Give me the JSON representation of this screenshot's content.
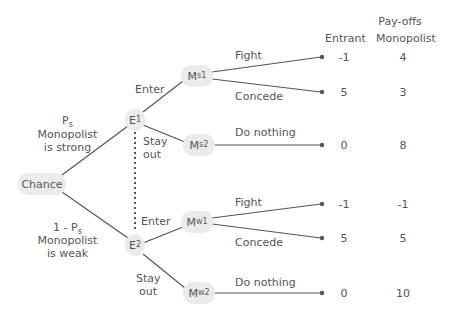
{
  "header": {
    "title": "Pay-offs",
    "col_entrant": "Entrant",
    "col_monopolist": "Monopolist"
  },
  "chance": {
    "label": "Chance",
    "strong_prob": "P",
    "strong_prob_sub": "s",
    "strong_line1": "Monopolist",
    "strong_line2": "is strong",
    "weak_prob": "1 - P",
    "weak_prob_sub": "s",
    "weak_line1": "Monopolist",
    "weak_line2": "is weak"
  },
  "nodes": {
    "e1": {
      "main": "E",
      "sub": "1"
    },
    "e2": {
      "main": "E",
      "sub": "2"
    },
    "ms1": {
      "main": "M",
      "sub": "s1"
    },
    "ms2": {
      "main": "M",
      "sub": "s2"
    },
    "mw1": {
      "main": "M",
      "sub": "w1"
    },
    "mw2": {
      "main": "M",
      "sub": "w2"
    }
  },
  "actions": {
    "enter_top": "Enter",
    "stay_top_1": "Stay",
    "stay_top_2": "out",
    "enter_bottom": "Enter",
    "stay_bottom_1": "Stay",
    "stay_bottom_2": "out",
    "fight_top": "Fight",
    "concede_top": "Concede",
    "nothing_top": "Do nothing",
    "fight_bottom": "Fight",
    "concede_bottom": "Concede",
    "nothing_bottom": "Do nothing"
  },
  "payoffs": [
    {
      "outcome": "Strong, Enter, Fight",
      "entrant": "-1",
      "monopolist": "4"
    },
    {
      "outcome": "Strong, Enter, Concede",
      "entrant": "5",
      "monopolist": "3"
    },
    {
      "outcome": "Strong, Stay out, Do nothing",
      "entrant": "0",
      "monopolist": "8"
    },
    {
      "outcome": "Weak, Enter, Fight",
      "entrant": "-1",
      "monopolist": "-1"
    },
    {
      "outcome": "Weak, Enter, Concede",
      "entrant": "5",
      "monopolist": "5"
    },
    {
      "outcome": "Weak, Stay out, Do nothing",
      "entrant": "0",
      "monopolist": "10"
    }
  ],
  "colors": {
    "line": "#555555",
    "node_fill": "#ebebeb",
    "text": "#555555"
  }
}
